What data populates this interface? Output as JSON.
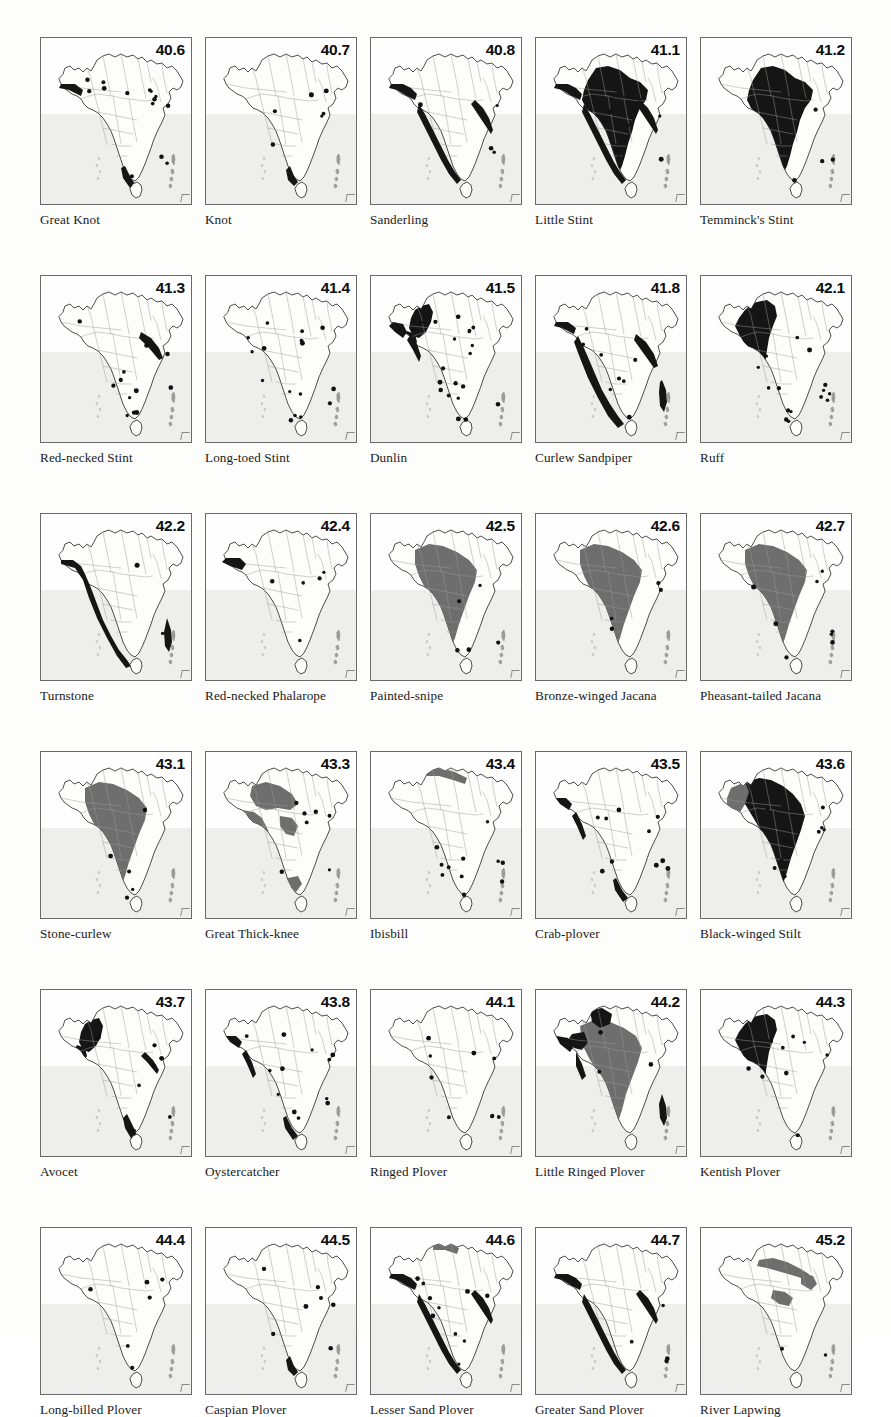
{
  "plate": {
    "title": "Distribution maps of South Asian shorebirds",
    "region": "Indian Subcontinent",
    "columns": 5,
    "rows": 6,
    "colors": {
      "land": "#fcfcfa",
      "sea": "#eeeeec",
      "border": "#6a6a6a",
      "state_line": "#9a9a9a",
      "coast_line": "#3a3a3a",
      "range_dark": "#151515",
      "range_mid": "#6e6e6e",
      "dot": "#101010",
      "text": "#1b1b1b"
    }
  },
  "panels": [
    {
      "fig": "40.6",
      "name": "Great Knot",
      "fill": "none",
      "coast": "partial-west-south",
      "dots": 14
    },
    {
      "fig": "40.7",
      "name": "Knot",
      "fill": "none",
      "coast": "south-tip",
      "dots": 6
    },
    {
      "fig": "40.8",
      "name": "Sanderling",
      "fill": "none",
      "coast": "full-coast",
      "dots": 4
    },
    {
      "fig": "41.1",
      "name": "Little Stint",
      "fill": "dark",
      "coast": "full-coast",
      "dots": 7
    },
    {
      "fig": "41.2",
      "name": "Temminck's Stint",
      "fill": "dark",
      "coast": "none",
      "dots": 5
    },
    {
      "fig": "41.3",
      "name": "Red-necked Stint",
      "fill": "none",
      "coast": "east-coast",
      "dots": 12
    },
    {
      "fig": "41.4",
      "name": "Long-toed Stint",
      "fill": "none",
      "coast": "none",
      "dots": 16
    },
    {
      "fig": "41.5",
      "name": "Dunlin",
      "fill": "dark-nw",
      "coast": "west-patches",
      "dots": 20
    },
    {
      "fig": "41.8",
      "name": "Curlew Sandpiper",
      "fill": "none",
      "coast": "coast-heavy",
      "dots": 8
    },
    {
      "fig": "42.1",
      "name": "Ruff",
      "fill": "dark-band",
      "coast": "none",
      "dots": 16
    },
    {
      "fig": "42.2",
      "name": "Turnstone",
      "fill": "none",
      "coast": "coast-outline",
      "dots": 2
    },
    {
      "fig": "42.4",
      "name": "Red-necked Phalarope",
      "fill": "none",
      "coast": "nw-patch",
      "dots": 5
    },
    {
      "fig": "42.5",
      "name": "Painted-snipe",
      "fill": "mid",
      "coast": "none",
      "dots": 5
    },
    {
      "fig": "42.6",
      "name": "Bronze-winged Jacana",
      "fill": "mid",
      "coast": "none",
      "dots": 4
    },
    {
      "fig": "42.7",
      "name": "Pheasant-tailed Jacana",
      "fill": "mid",
      "coast": "none",
      "dots": 8
    },
    {
      "fig": "43.1",
      "name": "Stone-curlew",
      "fill": "mid",
      "coast": "none",
      "dots": 5
    },
    {
      "fig": "43.3",
      "name": "Great Thick-knee",
      "fill": "mid-patchy",
      "coast": "none",
      "dots": 7
    },
    {
      "fig": "43.4",
      "name": "Ibisbill",
      "fill": "himalaya",
      "coast": "none",
      "dots": 11
    },
    {
      "fig": "43.5",
      "name": "Crab-plover",
      "fill": "none",
      "coast": "coast-dots",
      "dots": 10
    },
    {
      "fig": "43.6",
      "name": "Black-winged Stilt",
      "fill": "dark-mid",
      "coast": "none",
      "dots": 9
    },
    {
      "fig": "43.7",
      "name": "Avocet",
      "fill": "dark-nw",
      "coast": "south-east",
      "dots": 8
    },
    {
      "fig": "43.8",
      "name": "Oystercatcher",
      "fill": "none",
      "coast": "coast-dots",
      "dots": 12
    },
    {
      "fig": "44.1",
      "name": "Ringed Plover",
      "fill": "none",
      "coast": "none",
      "dots": 10
    },
    {
      "fig": "44.2",
      "name": "Little Ringed Plover",
      "fill": "mid-dark-n",
      "coast": "west-coast",
      "dots": 3
    },
    {
      "fig": "44.3",
      "name": "Kentish Plover",
      "fill": "dark-band",
      "coast": "none",
      "dots": 9
    },
    {
      "fig": "44.4",
      "name": "Long-billed Plover",
      "fill": "none",
      "coast": "none",
      "dots": 6
    },
    {
      "fig": "44.5",
      "name": "Caspian Plover",
      "fill": "none",
      "coast": "south-tip",
      "dots": 7
    },
    {
      "fig": "44.6",
      "name": "Lesser Sand Plover",
      "fill": "himalaya-sm",
      "coast": "full-coast",
      "dots": 11
    },
    {
      "fig": "44.7",
      "name": "Greater Sand Plover",
      "fill": "none",
      "coast": "full-coast",
      "dots": 4
    },
    {
      "fig": "45.2",
      "name": "River Lapwing",
      "fill": "river-band",
      "coast": "none",
      "dots": 2
    }
  ]
}
